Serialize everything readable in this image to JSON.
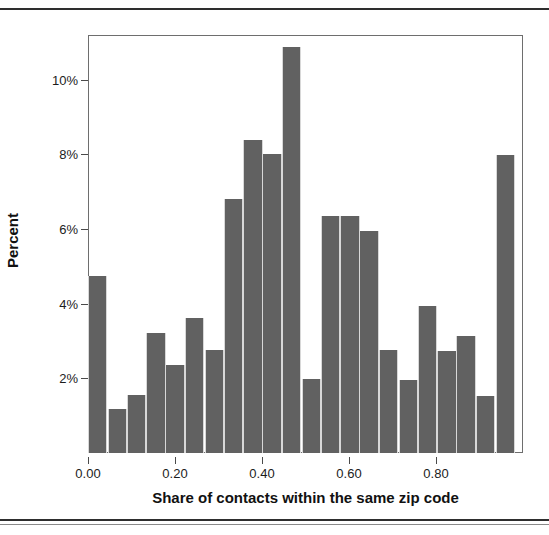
{
  "figure": {
    "background_color": "#ffffff",
    "frame_color": "#6e6e6e",
    "bar_color": "#616161",
    "bar_edge_color": "#d8d8d8",
    "text_color": "#111111"
  },
  "chart_data": {
    "type": "bar",
    "chart_kind": "histogram",
    "title": "",
    "xlabel": "Share of contacts within the same zip code",
    "ylabel": "Percent",
    "xlim": [
      0.0,
      1.0
    ],
    "ylim": [
      0,
      11.2
    ],
    "grid": false,
    "legend": null,
    "x_tick_labels": [
      "0.00",
      "0.20",
      "0.40",
      "0.60",
      "0.80"
    ],
    "x_tick_values": [
      0.0,
      0.2,
      0.4,
      0.6,
      0.8
    ],
    "y_tick_labels": [
      "2%",
      "4%",
      "6%",
      "8%",
      "10%"
    ],
    "y_tick_values": [
      2,
      4,
      6,
      8,
      10
    ],
    "bin_width": 0.0446,
    "bin_starts": [
      0.0,
      0.045,
      0.089,
      0.134,
      0.178,
      0.223,
      0.268,
      0.312,
      0.357,
      0.401,
      0.446,
      0.491,
      0.535,
      0.58,
      0.624,
      0.669,
      0.714,
      0.758,
      0.803,
      0.847,
      0.892,
      0.937
    ],
    "bin_centers": [
      0.022,
      0.067,
      0.112,
      0.156,
      0.201,
      0.245,
      0.29,
      0.334,
      0.379,
      0.424,
      0.468,
      0.513,
      0.557,
      0.602,
      0.647,
      0.691,
      0.736,
      0.78,
      0.825,
      0.87,
      0.914,
      0.959
    ],
    "categories": [
      "0.00-0.04",
      "0.04-0.09",
      "0.09-0.13",
      "0.13-0.18",
      "0.18-0.22",
      "0.22-0.27",
      "0.27-0.31",
      "0.31-0.36",
      "0.36-0.40",
      "0.40-0.45",
      "0.45-0.49",
      "0.49-0.54",
      "0.54-0.58",
      "0.58-0.62",
      "0.62-0.67",
      "0.67-0.71",
      "0.71-0.76",
      "0.76-0.80",
      "0.80-0.85",
      "0.85-0.89",
      "0.89-0.94",
      "0.94-0.98"
    ],
    "values": [
      4.75,
      1.17,
      1.55,
      3.22,
      2.36,
      3.62,
      2.76,
      6.8,
      8.4,
      8.0,
      10.87,
      1.97,
      6.36,
      6.36,
      5.95,
      2.76,
      1.95,
      3.93,
      2.73,
      3.13,
      1.53,
      7.98
    ],
    "unit": "%"
  }
}
